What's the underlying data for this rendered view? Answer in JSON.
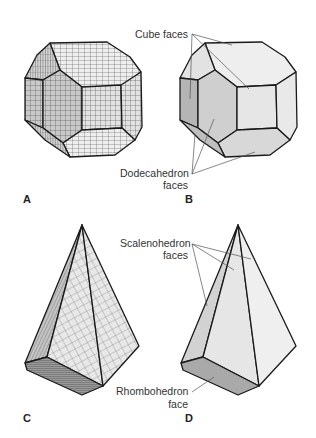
{
  "figure": {
    "colors": {
      "background": "#ffffff",
      "edge": "#1a1a1a",
      "face_light": "#ececec",
      "face_mid": "#d6d6d6",
      "face_dark": "#bdbdbd",
      "face_darkest": "#a8a8a8",
      "grid": "#555555",
      "leader": "#555555",
      "text": "#333333"
    },
    "panels": [
      {
        "id": "A",
        "letter": "A",
        "content": "Unit-cell stacked cube-dodecahedron crystal"
      },
      {
        "id": "B",
        "letter": "B",
        "content": "Idealized cube-dodecahedron crystal",
        "labels": [
          {
            "text": "Cube faces",
            "targets": 3
          },
          {
            "line1": "Dodecahedron",
            "line2": "faces",
            "targets": 3
          }
        ]
      },
      {
        "id": "C",
        "letter": "C",
        "content": "Unit-cell stacked scalenohedron crystal"
      },
      {
        "id": "D",
        "letter": "D",
        "content": "Idealized scalenohedron crystal",
        "labels": [
          {
            "line1": "Scalenohedron",
            "line2": "faces",
            "targets": 3
          },
          {
            "line1": "Rhombohedron",
            "line2": "face",
            "targets": 1
          }
        ]
      }
    ]
  },
  "labels": {
    "cube_faces": "Cube faces",
    "dodecahedron_line1": "Dodecahedron",
    "dodecahedron_line2": "faces",
    "scalenohedron_line1": "Scalenohedron",
    "scalenohedron_line2": "faces",
    "rhombohedron_line1": "Rhombohedron",
    "rhombohedron_line2": "face"
  },
  "panel_letters": {
    "a": "A",
    "b": "B",
    "c": "C",
    "d": "D"
  }
}
